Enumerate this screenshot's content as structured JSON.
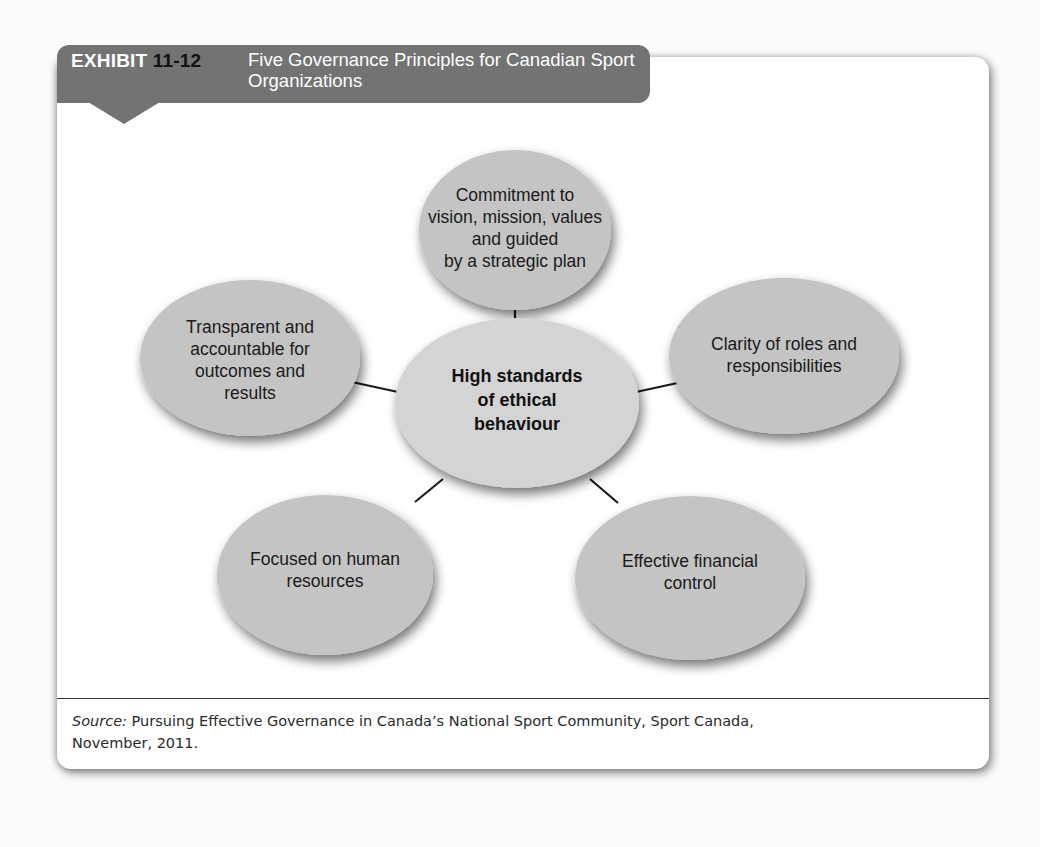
{
  "header": {
    "exhibit_word": "EXHIBIT",
    "exhibit_number": "11-12",
    "title": "Five Governance Principles for Canadian Sport Organizations",
    "tab_color": "#737373"
  },
  "diagram": {
    "center": {
      "label": "High standards of ethical behaviour",
      "lines": [
        "High standards",
        "of ethical",
        "behaviour"
      ]
    },
    "nodes": [
      {
        "id": "top",
        "label": "Commitment to vision, mission, values and guided by a strategic plan",
        "lines": [
          "Commitment to",
          "vision, mission, values",
          "and guided",
          "by a strategic plan"
        ]
      },
      {
        "id": "left",
        "label": "Transparent and accountable for outcomes and results",
        "lines": [
          "Transparent and",
          "accountable for",
          "outcomes and",
          "results"
        ]
      },
      {
        "id": "right",
        "label": "Clarity of roles and responsibilities",
        "lines": [
          "Clarity of roles and",
          "responsibilities"
        ]
      },
      {
        "id": "bottom-left",
        "label": "Focused on human resources",
        "lines": [
          "Focused on human",
          "resources"
        ]
      },
      {
        "id": "bottom-right",
        "label": "Effective financial control",
        "lines": [
          "Effective financial",
          "control"
        ]
      }
    ],
    "ellipse_color": "#c4c4c4",
    "center_color": "#d4d4d4",
    "connector_color": "#1a1a1a"
  },
  "source": {
    "label": "Source:",
    "text": " Pursuing Effective Governance in Canada’s National Sport Community, Sport Canada,",
    "text_line2": "November, 2011."
  }
}
